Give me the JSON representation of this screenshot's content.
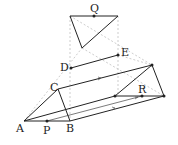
{
  "diagram": {
    "type": "geometry-prism-projection",
    "labels": {
      "A": "A",
      "B": "B",
      "C": "C",
      "D": "D",
      "E": "E",
      "P": "P",
      "Q": "Q",
      "R": "R"
    },
    "colors": {
      "solid": "#222222",
      "dashed": "#aaaaaa",
      "dotted": "#bbbbbb"
    }
  }
}
